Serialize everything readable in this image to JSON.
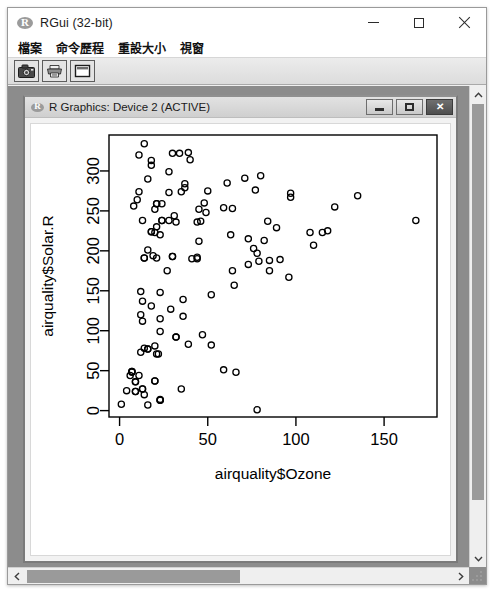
{
  "window": {
    "title": "RGui (32-bit)",
    "icon": "r-logo-icon",
    "controls": {
      "minimize": "−",
      "maximize": "□",
      "close": "✕"
    }
  },
  "menubar": {
    "items": [
      {
        "label": "檔案",
        "name": "menu-file"
      },
      {
        "label": "命令歷程",
        "name": "menu-history"
      },
      {
        "label": "重設大小",
        "name": "menu-resize"
      },
      {
        "label": "視窗",
        "name": "menu-windows"
      }
    ]
  },
  "toolbar": {
    "buttons": [
      {
        "name": "copy-to-clipboard-button",
        "icon": "camera-icon"
      },
      {
        "name": "print-button",
        "icon": "printer-icon"
      },
      {
        "name": "window-button",
        "icon": "window-icon"
      }
    ]
  },
  "device_window": {
    "title": "R Graphics: Device 2 (ACTIVE)",
    "icon": "r-logo-icon",
    "controls": {
      "minimize": "–",
      "restore": "■",
      "close": "✕"
    }
  },
  "scrollbars": {
    "vertical": {
      "up": "⌃",
      "down": "⌄"
    },
    "horizontal": {
      "left": "‹",
      "right": "›"
    }
  },
  "chart_data": {
    "type": "scatter",
    "title": "",
    "xlabel": "airquality$Ozone",
    "ylabel": "airquality$Solar.R",
    "xlim": [
      -6,
      180
    ],
    "ylim": [
      -8,
      345
    ],
    "xticks": [
      0,
      50,
      100,
      150
    ],
    "yticks": [
      0,
      50,
      100,
      150,
      200,
      250,
      300
    ],
    "grid": false,
    "legend": null,
    "marker": "open-circle",
    "marker_color": "#000000",
    "marker_radius": 3.1,
    "series": [
      {
        "name": "airquality",
        "points": [
          [
            41,
            190
          ],
          [
            36,
            118
          ],
          [
            12,
            149
          ],
          [
            18,
            313
          ],
          [
            28,
            299
          ],
          [
            23,
            99
          ],
          [
            19,
            194
          ],
          [
            8,
            256
          ],
          [
            16,
            290
          ],
          [
            11,
            274
          ],
          [
            14,
            334
          ],
          [
            18,
            307
          ],
          [
            14,
            78
          ],
          [
            34,
            322
          ],
          [
            6,
            44
          ],
          [
            30,
            322
          ],
          [
            11,
            44
          ],
          [
            1,
            8
          ],
          [
            11,
            320
          ],
          [
            4,
            25
          ],
          [
            32,
            92
          ],
          [
            23,
            13
          ],
          [
            45,
            252
          ],
          [
            115,
            223
          ],
          [
            37,
            279
          ],
          [
            29,
            127
          ],
          [
            71,
            291
          ],
          [
            39,
            323
          ],
          [
            23,
            148
          ],
          [
            21,
            191
          ],
          [
            37,
            284
          ],
          [
            20,
            37
          ],
          [
            12,
            120
          ],
          [
            13,
            137
          ],
          [
            135,
            269
          ],
          [
            49,
            248
          ],
          [
            32,
            236
          ],
          [
            64,
            175
          ],
          [
            40,
            314
          ],
          [
            77,
            276
          ],
          [
            97,
            267
          ],
          [
            97,
            272
          ],
          [
            85,
            175
          ],
          [
            10,
            264
          ],
          [
            27,
            175
          ],
          [
            7,
            48
          ],
          [
            48,
            260
          ],
          [
            35,
            274
          ],
          [
            61,
            285
          ],
          [
            79,
            187
          ],
          [
            63,
            220
          ],
          [
            16,
            7
          ],
          [
            80,
            294
          ],
          [
            108,
            223
          ],
          [
            20,
            81
          ],
          [
            52,
            82
          ],
          [
            82,
            213
          ],
          [
            50,
            275
          ],
          [
            64,
            253
          ],
          [
            59,
            254
          ],
          [
            39,
            83
          ],
          [
            9,
            24
          ],
          [
            16,
            77
          ],
          [
            78,
            1
          ],
          [
            35,
            27
          ],
          [
            66,
            48
          ],
          [
            122,
            255
          ],
          [
            89,
            229
          ],
          [
            110,
            207
          ],
          [
            44,
            192
          ],
          [
            28,
            273
          ],
          [
            65,
            157
          ],
          [
            22,
            71
          ],
          [
            59,
            51
          ],
          [
            23,
            115
          ],
          [
            31,
            244
          ],
          [
            44,
            190
          ],
          [
            21,
            259
          ],
          [
            9,
            36
          ],
          [
            45,
            212
          ],
          [
            168,
            238
          ],
          [
            73,
            215
          ],
          [
            76,
            203
          ],
          [
            118,
            225
          ],
          [
            84,
            237
          ],
          [
            85,
            188
          ],
          [
            96,
            167
          ],
          [
            78,
            197
          ],
          [
            73,
            183
          ],
          [
            91,
            189
          ],
          [
            47,
            95
          ],
          [
            32,
            92
          ],
          [
            20,
            252
          ],
          [
            23,
            220
          ],
          [
            21,
            230
          ],
          [
            24,
            259
          ],
          [
            44,
            236
          ],
          [
            21,
            259
          ],
          [
            28,
            238
          ],
          [
            9,
            24
          ],
          [
            13,
            112
          ],
          [
            46,
            237
          ],
          [
            18,
            224
          ],
          [
            13,
            27
          ],
          [
            24,
            238
          ],
          [
            16,
            201
          ],
          [
            13,
            238
          ],
          [
            23,
            14
          ],
          [
            36,
            139
          ],
          [
            7,
            49
          ],
          [
            14,
            20
          ],
          [
            30,
            193
          ],
          [
            14,
            191
          ],
          [
            18,
            131
          ],
          [
            20,
            223
          ],
          [
            52,
            145
          ],
          [
            12,
            73
          ],
          [
            24,
            238
          ],
          [
            13,
            27
          ],
          [
            14,
            191
          ],
          [
            30,
            193
          ],
          [
            20,
            37
          ],
          [
            9,
            36
          ],
          [
            16,
            77
          ],
          [
            23,
            13
          ],
          [
            21,
            71
          ],
          [
            18,
            224
          ],
          [
            7,
            49
          ]
        ]
      }
    ]
  }
}
